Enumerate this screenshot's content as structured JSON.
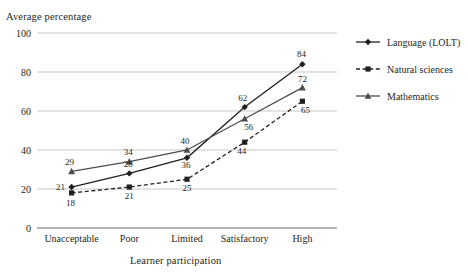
{
  "figure": {
    "clipped_header_text": "",
    "y_axis_title": "Average percentage",
    "x_axis_title": "Learner participation"
  },
  "legend": {
    "position": "right",
    "items": [
      {
        "label": "Language (LOLT)",
        "marker": "diamond",
        "line": "solid"
      },
      {
        "label": "Natural sciences",
        "marker": "square",
        "line": "dashed"
      },
      {
        "label": "Mathematics",
        "marker": "triangle",
        "line": "solid"
      }
    ]
  },
  "chart_data": {
    "type": "line",
    "title": "",
    "xlabel": "Learner participation",
    "ylabel": "Average percentage",
    "categories": [
      "Unacceptable",
      "Poor",
      "Limited",
      "Satisfactory",
      "High"
    ],
    "yticks": [
      0,
      20,
      40,
      60,
      80,
      100
    ],
    "ylim": [
      0,
      100
    ],
    "grid": true,
    "legend_position": "right",
    "series": [
      {
        "name": "Language (LOLT)",
        "values": [
          21,
          28,
          36,
          62,
          84
        ],
        "marker": "diamond",
        "line": "solid",
        "color": "#231f20"
      },
      {
        "name": "Natural sciences",
        "values": [
          18,
          21,
          25,
          44,
          65
        ],
        "marker": "square",
        "line": "dashed",
        "color": "#231f20"
      },
      {
        "name": "Mathematics",
        "values": [
          29,
          34,
          40,
          56,
          72
        ],
        "marker": "triangle",
        "line": "solid",
        "color": "#4d4d52"
      }
    ]
  }
}
